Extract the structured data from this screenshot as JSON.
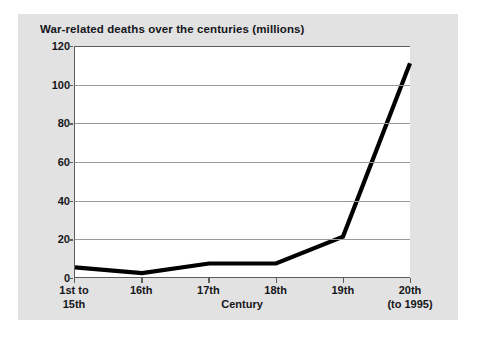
{
  "chart_data": {
    "type": "line",
    "title": "War-related deaths over the centuries (millions)",
    "xlabel": "Century",
    "ylabel": "",
    "categories": [
      "1st to 15th",
      "16th",
      "17th",
      "18th",
      "19th",
      "20th (to 1995)"
    ],
    "category_labels": [
      {
        "line1": "1st to",
        "line2": "15th"
      },
      {
        "line1": "16th",
        "line2": ""
      },
      {
        "line1": "17th",
        "line2": ""
      },
      {
        "line1": "18th",
        "line2": ""
      },
      {
        "line1": "19th",
        "line2": ""
      },
      {
        "line1": "20th",
        "line2": "(to 1995)"
      }
    ],
    "values": [
      5,
      2,
      7,
      7,
      21,
      111
    ],
    "ylim": [
      0,
      120
    ],
    "ytick_labels": [
      "120",
      "100",
      "80",
      "60",
      "40",
      "20",
      "0"
    ],
    "ytick_values": [
      120,
      100,
      80,
      60,
      40,
      20,
      0
    ],
    "grid": true,
    "legend": "none",
    "series_color": "#000000",
    "gridline_color": "#9a9a9a",
    "axis_color": "#5c5c5c",
    "plot_background": "#ffffff",
    "panel_background": "#e2e2e2"
  }
}
